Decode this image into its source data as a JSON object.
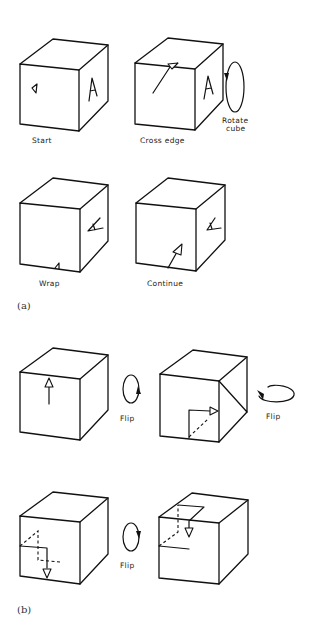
{
  "figure": {
    "panel_a": {
      "label": "(a)",
      "steps": [
        {
          "caption": "Start"
        },
        {
          "caption": "Cross edge",
          "side_note_line1": "Rotate",
          "side_note_line2": "cube"
        },
        {
          "caption": "Wrap"
        },
        {
          "caption": "Continue"
        }
      ],
      "face_letter": "A"
    },
    "panel_b": {
      "label": "(b)",
      "flip_labels": [
        "Flip",
        "Flip",
        "Flip"
      ]
    }
  }
}
